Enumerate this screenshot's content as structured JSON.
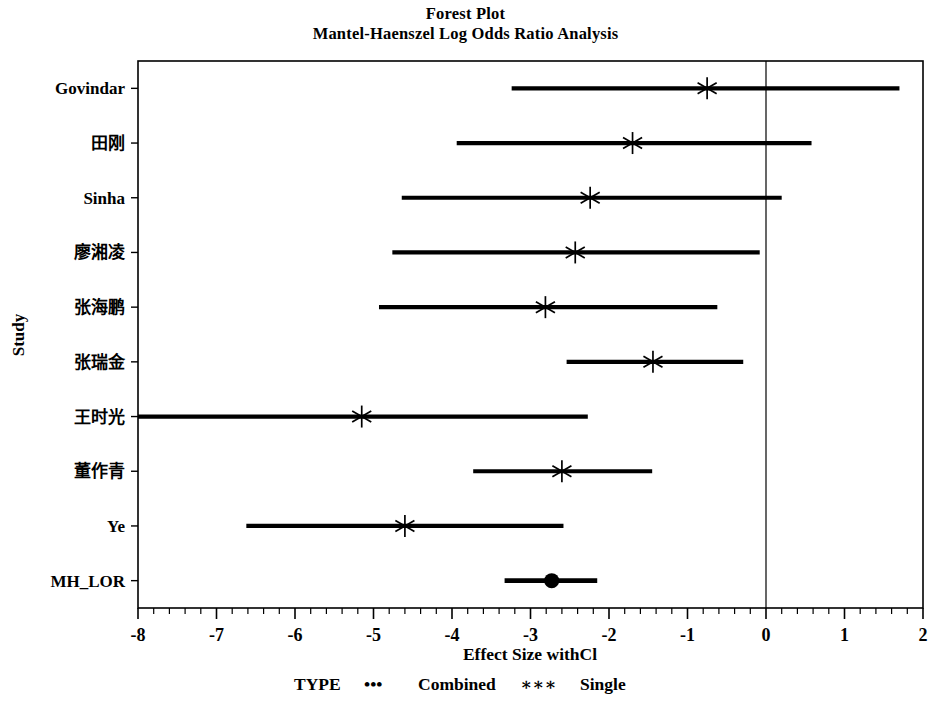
{
  "figure": {
    "title": "Forest Plot",
    "subtitle": "Mantel-Haenszel Log Odds Ratio Analysis"
  },
  "axes": {
    "ylabel": "Study",
    "xlabel": "Effect Size withCl",
    "xticks": [
      "-8",
      "-7",
      "-6",
      "-5",
      "-4",
      "-3",
      "-2",
      "-1",
      "0",
      "1",
      "2"
    ],
    "reference_line_value": "0"
  },
  "legend": {
    "title": "TYPE",
    "combined_symbol": "•••",
    "combined_label": "Combined",
    "single_symbol": "∗∗∗",
    "single_label": "Single"
  },
  "colors": {
    "foreground": "#000000",
    "background": "#ffffff"
  },
  "chart_data": {
    "type": "forest",
    "title": "Forest Plot",
    "subtitle": "Mantel-Haenszel Log Odds Ratio Analysis",
    "xlabel": "Effect Size withCl",
    "ylabel": "Study",
    "xlim": [
      -8,
      2
    ],
    "xticks": [
      -8,
      -7,
      -6,
      -5,
      -4,
      -3,
      -2,
      -1,
      0,
      1,
      2
    ],
    "minor_ticks_per_interval": 5,
    "grid": false,
    "reference_line": 0,
    "legend": {
      "title": "TYPE",
      "entries": [
        {
          "label": "Combined",
          "marker": "dot"
        },
        {
          "label": "Single",
          "marker": "star"
        }
      ],
      "position": "below-axis"
    },
    "categories": [
      "Govindar",
      "田刚",
      "Sinha",
      "廖湘凌",
      "张海鹏",
      "张瑞金",
      "王时光",
      "董作青",
      "Ye",
      "MH_LOR"
    ],
    "rows": [
      {
        "study": "Govindar",
        "estimate": -0.75,
        "ci_low": -3.24,
        "ci_high": 1.7,
        "type": "Single",
        "clipped_low": false
      },
      {
        "study": "田刚",
        "estimate": -1.7,
        "ci_low": -3.94,
        "ci_high": 0.58,
        "type": "Single",
        "clipped_low": false
      },
      {
        "study": "Sinha",
        "estimate": -2.24,
        "ci_low": -4.64,
        "ci_high": 0.2,
        "type": "Single",
        "clipped_low": false
      },
      {
        "study": "廖湘凌",
        "estimate": -2.43,
        "ci_low": -4.76,
        "ci_high": -0.08,
        "type": "Single",
        "clipped_low": false
      },
      {
        "study": "张海鹏",
        "estimate": -2.81,
        "ci_low": -4.93,
        "ci_high": -0.62,
        "type": "Single",
        "clipped_low": false
      },
      {
        "study": "张瑞金",
        "estimate": -1.44,
        "ci_low": -2.54,
        "ci_high": -0.29,
        "type": "Single",
        "clipped_low": false
      },
      {
        "study": "王时光",
        "estimate": -5.15,
        "ci_low": -8.0,
        "ci_high": -2.27,
        "type": "Single",
        "clipped_low": true
      },
      {
        "study": "董作青",
        "estimate": -2.6,
        "ci_low": -3.73,
        "ci_high": -1.45,
        "type": "Single",
        "clipped_low": false
      },
      {
        "study": "Ye",
        "estimate": -4.6,
        "ci_low": -6.62,
        "ci_high": -2.58,
        "type": "Single",
        "clipped_low": false
      },
      {
        "study": "MH_LOR",
        "estimate": -2.73,
        "ci_low": -3.33,
        "ci_high": -2.15,
        "type": "Combined",
        "clipped_low": false
      }
    ]
  }
}
